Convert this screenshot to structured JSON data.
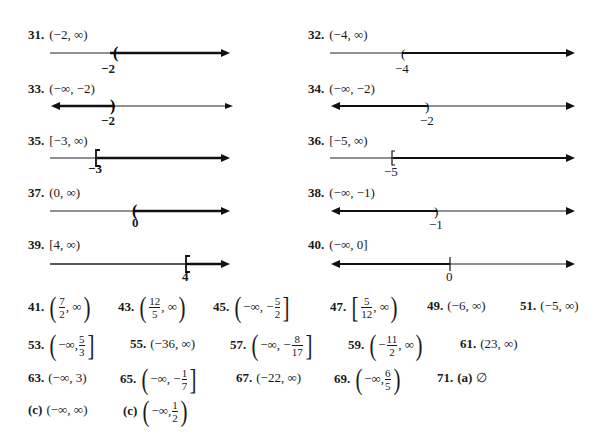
{
  "number_lines": [
    {
      "id": "31",
      "label": "31.",
      "interval": "(−2, ∞)",
      "tick": "−2",
      "endpoint": "open",
      "direction": "right"
    },
    {
      "id": "32",
      "label": "32.",
      "interval": "(−4, ∞)",
      "tick": "−4",
      "endpoint": "open",
      "direction": "right"
    },
    {
      "id": "33",
      "label": "33.",
      "interval": "(−∞, −2)",
      "tick": "−2",
      "endpoint": "open",
      "direction": "left"
    },
    {
      "id": "34",
      "label": "34.",
      "interval": "(−∞, −2)",
      "tick": "−2",
      "endpoint": "open",
      "direction": "left"
    },
    {
      "id": "35",
      "label": "35.",
      "interval": "[−3, ∞)",
      "tick": "−3",
      "endpoint": "closed",
      "direction": "right"
    },
    {
      "id": "36",
      "label": "36.",
      "interval": "[−5, ∞)",
      "tick": "−5",
      "endpoint": "closed",
      "direction": "right"
    },
    {
      "id": "37",
      "label": "37.",
      "interval": "(0, ∞)",
      "tick": "0",
      "endpoint": "open",
      "direction": "right"
    },
    {
      "id": "38",
      "label": "38.",
      "interval": "(−∞, −1)",
      "tick": "−1",
      "endpoint": "open",
      "direction": "left"
    },
    {
      "id": "39",
      "label": "39.",
      "interval": "[4, ∞)",
      "tick": "4",
      "endpoint": "closed",
      "direction": "right"
    },
    {
      "id": "40",
      "label": "40.",
      "interval": "(−∞, 0]",
      "tick": "0",
      "endpoint": "closed",
      "direction": "left"
    }
  ],
  "answers": {
    "a41": {
      "num": "41.",
      "open": "(",
      "frac_n": "7",
      "frac_d": "2",
      "rest": ", ∞",
      "close": ")"
    },
    "a43": {
      "num": "43.",
      "open": "(",
      "frac_n": "12",
      "frac_d": "5",
      "rest": ", ∞",
      "close": ")"
    },
    "a45": {
      "num": "45.",
      "open": "(",
      "pre": "−∞, −",
      "frac_n": "5",
      "frac_d": "2",
      "close": "]"
    },
    "a47": {
      "num": "47.",
      "open": "[",
      "frac_n": "5",
      "frac_d": "12",
      "rest": ", ∞",
      "close": ")"
    },
    "a49": {
      "num": "49.",
      "text": "(−6, ∞)"
    },
    "a51": {
      "num": "51.",
      "text": "(−5, ∞)"
    },
    "a53": {
      "num": "53.",
      "open": "(",
      "pre": "−∞, ",
      "frac_n": "5",
      "frac_d": "3",
      "close": "]"
    },
    "a55": {
      "num": "55.",
      "text": "(−36, ∞)"
    },
    "a57": {
      "num": "57.",
      "open": "(",
      "pre": "−∞, −",
      "frac_n": "8",
      "frac_d": "17",
      "close": "]"
    },
    "a59": {
      "num": "59.",
      "open": "(",
      "pre": "−",
      "frac_n": "11",
      "frac_d": "2",
      "rest": ", ∞",
      "close": ")"
    },
    "a61": {
      "num": "61.",
      "text": "(23, ∞)"
    },
    "a63": {
      "num": "63.",
      "text": "(−∞, 3)"
    },
    "a65": {
      "num": "65.",
      "open": "(",
      "pre": "−∞, −",
      "frac_n": "1",
      "frac_d": "7",
      "close": "]"
    },
    "a67": {
      "num": "67.",
      "text": "(−22, ∞)"
    },
    "a69": {
      "num": "69.",
      "open": "(",
      "pre": "−∞, ",
      "frac_n": "6",
      "frac_d": "5",
      "close": ")"
    },
    "a71": {
      "num": "71.",
      "part": "(a)",
      "text": "∅"
    },
    "c1": {
      "num": "(c)",
      "text": "(−∞, ∞)"
    },
    "c2": {
      "num": "(c)",
      "open": "(",
      "pre": "−∞, ",
      "frac_n": "1",
      "frac_d": "2",
      "close": ")"
    }
  }
}
